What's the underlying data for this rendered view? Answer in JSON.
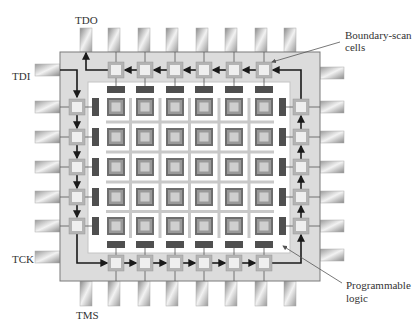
{
  "labels": {
    "tdo": "TDO",
    "tdi": "TDI",
    "tck": "TCK",
    "tms": "TMS",
    "boundary_scan_line1": "Boundary-scan",
    "boundary_scan_line2": "cells",
    "prog_logic_line1": "Programmable",
    "prog_logic_line2": "logic"
  },
  "layout": {
    "chip": {
      "x": 60,
      "y": 52,
      "w": 260,
      "h": 229
    },
    "inner": {
      "x": 88,
      "y": 82,
      "w": 202,
      "h": 171
    },
    "column_centers": [
      116,
      145,
      175,
      204,
      234,
      264
    ],
    "row_centers": [
      107,
      137,
      167,
      197,
      226
    ],
    "top_pins_x": [
      86,
      114,
      144,
      172,
      202,
      231,
      261,
      290
    ],
    "bottom_pins_x": [
      86,
      114,
      144,
      172,
      202,
      231,
      261,
      290
    ],
    "left_pins_y": [
      70,
      107,
      137,
      167,
      197,
      226,
      257
    ],
    "right_pins_y": [
      73,
      107,
      137,
      167,
      197,
      226,
      255
    ],
    "bsc_top_y": 70,
    "bsc_bottom_y": 263,
    "bsc_left_x": 77,
    "bsc_right_x": 301
  },
  "counts": {
    "logic_block_columns": 6,
    "logic_block_rows": 5,
    "boundary_scan_cells": 22,
    "pins_per_side_top_bottom": 8,
    "pins_per_side_left_right": 7
  },
  "colors": {
    "chip_fill": "#dcdcdc",
    "chip_stroke": "#7a7a7a",
    "inner_fill": "#ffffff",
    "bsc_outer": "#b4b4b4",
    "bsc_inner": "#efefef",
    "logic_outer": "#6e6e6e",
    "logic_mid": "#9a9a9a",
    "logic_inner": "#cfcfcf",
    "io_tab": "#4f4f4f",
    "routing": "#c8c8c8",
    "scan_path": "#1a1a1a"
  }
}
